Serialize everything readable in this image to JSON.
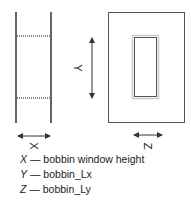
{
  "labels": {
    "x": "X",
    "y": "Y",
    "z": "Z"
  },
  "legend": [
    {
      "key": "X",
      "sep": " — ",
      "text": "bobbin window height"
    },
    {
      "key": "Y",
      "sep": " — ",
      "text": "bobbin_Lx"
    },
    {
      "key": "Z",
      "sep": " — ",
      "text": "bobbin_Ly"
    }
  ],
  "colors": {
    "line": "#555555",
    "hatch": "#888888",
    "text": "#222222"
  }
}
